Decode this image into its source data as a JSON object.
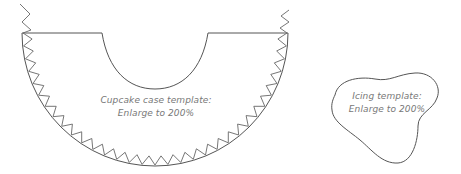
{
  "cupcake_template": {
    "line1": "Cupcake case template:",
    "line2": "Enlarge to 200%"
  },
  "icing_template": {
    "line1": "Icing template:",
    "line2": "Enlarge to 200%"
  },
  "colors": {
    "stroke": "#555555",
    "text": "#777777",
    "background": "#ffffff"
  }
}
